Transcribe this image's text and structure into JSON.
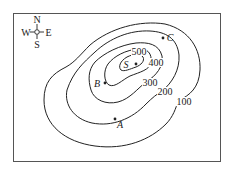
{
  "figure": {
    "type": "topographic contour map",
    "compass": {
      "north": "N",
      "south": "S",
      "east": "E",
      "west": "W"
    },
    "contours": [
      {
        "value": 100,
        "label": "100"
      },
      {
        "value": 200,
        "label": "200"
      },
      {
        "value": 300,
        "label": "300"
      },
      {
        "value": 400,
        "label": "400"
      },
      {
        "value": 500,
        "label": "500"
      }
    ],
    "points": [
      {
        "name": "S",
        "label": "S",
        "description": "summit"
      },
      {
        "name": "A",
        "label": "A"
      },
      {
        "name": "B",
        "label": "B"
      },
      {
        "name": "C",
        "label": "C"
      }
    ],
    "colors": {
      "line": "#222222",
      "background": "#ffffff",
      "border": "#555555"
    }
  }
}
